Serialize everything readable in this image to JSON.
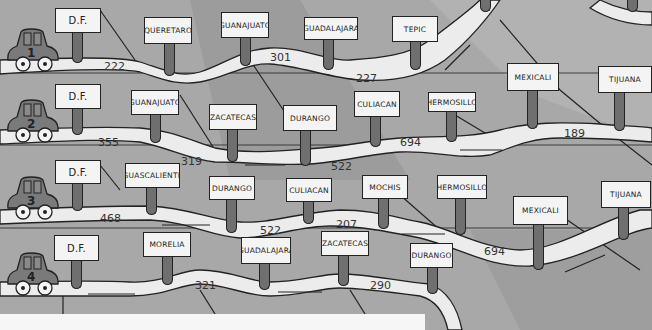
{
  "image": {
    "description": "Four road routes from D.F. to northwestern Mexico cities, each with a numbered car, signposts and distances"
  },
  "routes": [
    {
      "car_number": "1",
      "signs": [
        "D.F.",
        "Queretaro",
        "Guanajuato",
        "Guadalajara",
        "Tepic"
      ],
      "distances": [
        "222",
        "301",
        "227"
      ]
    },
    {
      "car_number": "2",
      "signs": [
        "D.F.",
        "Guanajuato",
        "Zacatecas",
        "Durango",
        "Culiacan",
        "Hermosillo",
        "Mexicali",
        "Tijuana"
      ],
      "distances": [
        "355",
        "319",
        "522",
        "694",
        "189"
      ]
    },
    {
      "car_number": "3",
      "signs": [
        "D.F.",
        "Aguascalientes",
        "Durango",
        "Culiacan",
        "Mochis",
        "Hermosillo",
        "Mexicali",
        "Tijuana"
      ],
      "distances": [
        "468",
        "522",
        "207",
        "694"
      ]
    },
    {
      "car_number": "4",
      "signs": [
        "D.F.",
        "Morelia",
        "Guadalajara",
        "Zacatecas",
        "Durango"
      ],
      "distances": [
        "321",
        "290"
      ]
    }
  ],
  "colors": {
    "background": "#a3a3a3",
    "road": "#ececec",
    "sign": "#f4f4f4",
    "post": "#6f6f6f",
    "outline": "#222222"
  }
}
